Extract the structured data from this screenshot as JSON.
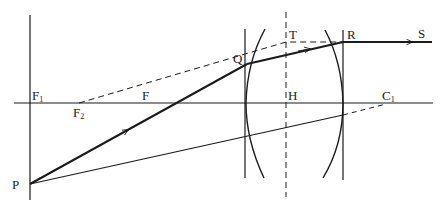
{
  "diagram": {
    "type": "optics-ray-diagram",
    "colors": {
      "ink": "#1a1a1a",
      "background": "#ffffff"
    },
    "labels": {
      "P": {
        "text": "P",
        "sub": ""
      },
      "F1": {
        "text": "F",
        "sub": "1"
      },
      "F2": {
        "text": "F",
        "sub": "2"
      },
      "F": {
        "text": "F",
        "sub": ""
      },
      "Q": {
        "text": "Q",
        "sub": ""
      },
      "T": {
        "text": "T",
        "sub": ""
      },
      "H": {
        "text": "H",
        "sub": ""
      },
      "R": {
        "text": "R",
        "sub": ""
      },
      "S": {
        "text": "S",
        "sub": ""
      },
      "C1": {
        "text": "C",
        "sub": "1"
      }
    },
    "elements": [
      "optical axis (horizontal line)",
      "vertical reference line through F1 and P",
      "left lens surface (plane + curved)",
      "right lens surface (plane + curved)",
      "dashed vertical line through T and H",
      "ray P-Q-R-S with arrows",
      "dashed construction line F2-T-R",
      "ray from P toward C1 (dashed beyond lens)"
    ]
  }
}
